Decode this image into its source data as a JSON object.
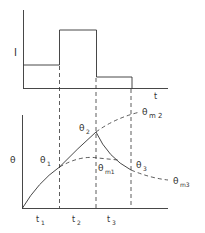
{
  "diagram": {
    "top_plot": {
      "ylabel": "I",
      "xlabel": "t",
      "levels": [
        {
          "from": "0",
          "to": "t1",
          "level": "low"
        },
        {
          "from": "t1",
          "to": "t2",
          "level": "high"
        },
        {
          "from": "t2",
          "to": "t3",
          "level": "lowest"
        }
      ]
    },
    "bottom_plot": {
      "ylabel": "θ",
      "points": {
        "theta1": "θ",
        "theta1_sub": "1",
        "theta2": "θ",
        "theta2_sub": "2",
        "theta3": "θ",
        "theta3_sub": "3"
      },
      "asymptotes": {
        "m1": "θ",
        "m1_sub": "m1",
        "m2": "θ",
        "m2_sub": "m 2",
        "m3": "θ",
        "m3_sub": "m3"
      },
      "time_labels": [
        {
          "t": "t",
          "sub": "1"
        },
        {
          "t": "t",
          "sub": "2"
        },
        {
          "t": "t",
          "sub": "3"
        }
      ]
    },
    "colors": {
      "line": "#333333",
      "background": "#ffffff"
    }
  }
}
